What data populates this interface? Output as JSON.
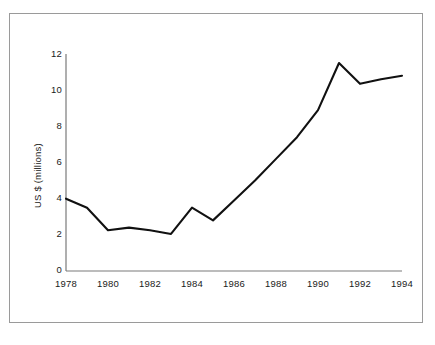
{
  "chart_data": {
    "type": "line",
    "title": "",
    "xlabel": "",
    "ylabel": "US $ (millions)",
    "xlim": [
      1978,
      1994
    ],
    "ylim": [
      0,
      12
    ],
    "grid": false,
    "legend": null,
    "x_ticks": [
      "1978",
      "1980",
      "1982",
      "1984",
      "1986",
      "1988",
      "1990",
      "1992",
      "1994"
    ],
    "y_ticks": [
      "0",
      "2",
      "4",
      "6",
      "8",
      "10",
      "12"
    ],
    "x": [
      1978,
      1979,
      1980,
      1981,
      1982,
      1983,
      1984,
      1985,
      1986,
      1987,
      1988,
      1989,
      1990,
      1991,
      1992,
      1993,
      1994
    ],
    "values": [
      4.0,
      3.5,
      2.25,
      2.4,
      2.25,
      2.05,
      3.5,
      2.8,
      3.9,
      5.0,
      6.2,
      7.4,
      8.9,
      11.5,
      10.35,
      10.6,
      10.8
    ],
    "series": [
      {
        "name": "US $ (millions)",
        "color": "#111111",
        "values": [
          4.0,
          3.5,
          2.25,
          2.4,
          2.25,
          2.05,
          3.5,
          2.8,
          3.9,
          5.0,
          6.2,
          7.4,
          8.9,
          11.5,
          10.35,
          10.6,
          10.8
        ]
      }
    ]
  },
  "axes": {
    "axis_color": "#7a7a7a",
    "line_color": "#111111",
    "frame_color": "#9a9a9a"
  }
}
